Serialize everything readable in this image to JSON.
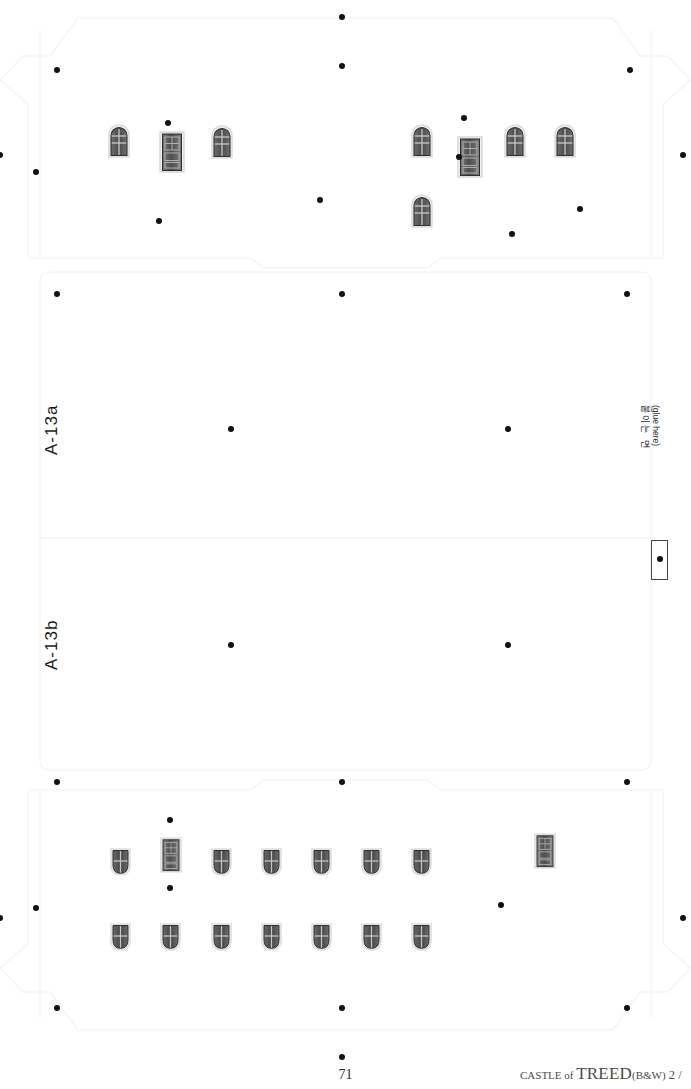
{
  "sheet": {
    "title": "CASTLE of TREED papercraft die-cut sheet",
    "page_number": "71",
    "credit_prefix": "CASTLE of ",
    "credit_title": "TREED",
    "credit_variant": "(B&W)",
    "credit_suffix": " 2 /",
    "background_color": "#ffffff",
    "line_color": "#f0f0f0",
    "dot_color": "#111111"
  },
  "part_labels": [
    {
      "name": "part-label-a13a",
      "text": "A-13a",
      "x": 42,
      "y": 455
    },
    {
      "name": "part-label-a13b",
      "text": "A-13b",
      "x": 42,
      "y": 670
    }
  ],
  "glue_tab": {
    "korean_label": "붙이는 면",
    "english_label": "(glue here)"
  },
  "window_groups": [
    {
      "name": "top-left-facade",
      "pieces": [
        {
          "type": "arch-win",
          "x": 108,
          "y": 124
        },
        {
          "type": "door",
          "x": 159,
          "y": 131
        },
        {
          "type": "arch-win",
          "x": 211,
          "y": 125
        }
      ]
    },
    {
      "name": "top-right-facade",
      "pieces": [
        {
          "type": "arch-win",
          "x": 411,
          "y": 124
        },
        {
          "type": "door",
          "x": 457,
          "y": 136
        },
        {
          "type": "arch-win",
          "x": 504,
          "y": 124
        },
        {
          "type": "arch-win",
          "x": 554,
          "y": 124
        },
        {
          "type": "arch-win",
          "x": 411,
          "y": 194
        }
      ]
    },
    {
      "name": "bottom-facade-row-1",
      "pieces": [
        {
          "type": "shield-win",
          "x": 110,
          "y": 847
        },
        {
          "type": "door-sm",
          "x": 160,
          "y": 837
        },
        {
          "type": "shield-win",
          "x": 211,
          "y": 847
        },
        {
          "type": "shield-win",
          "x": 261,
          "y": 847
        },
        {
          "type": "shield-win",
          "x": 311,
          "y": 847
        },
        {
          "type": "shield-win",
          "x": 361,
          "y": 847
        },
        {
          "type": "shield-win",
          "x": 411,
          "y": 847
        },
        {
          "type": "door-sm",
          "x": 534,
          "y": 833
        }
      ]
    },
    {
      "name": "bottom-facade-row-2",
      "pieces": [
        {
          "type": "shield-win",
          "x": 110,
          "y": 922
        },
        {
          "type": "shield-win",
          "x": 160,
          "y": 922
        },
        {
          "type": "shield-win",
          "x": 211,
          "y": 922
        },
        {
          "type": "shield-win",
          "x": 261,
          "y": 922
        },
        {
          "type": "shield-win",
          "x": 311,
          "y": 922
        },
        {
          "type": "shield-win",
          "x": 361,
          "y": 922
        },
        {
          "type": "shield-win",
          "x": 411,
          "y": 922
        }
      ]
    }
  ],
  "registration_dots": [
    {
      "x": 342,
      "y": 17
    },
    {
      "x": 342,
      "y": 66
    },
    {
      "x": 57,
      "y": 70
    },
    {
      "x": 630,
      "y": 70
    },
    {
      "x": 168,
      "y": 123
    },
    {
      "x": 464,
      "y": 118
    },
    {
      "x": 0,
      "y": 155
    },
    {
      "x": 683,
      "y": 155
    },
    {
      "x": 36,
      "y": 172
    },
    {
      "x": 459,
      "y": 157
    },
    {
      "x": 320,
      "y": 200
    },
    {
      "x": 580,
      "y": 209
    },
    {
      "x": 159,
      "y": 221
    },
    {
      "x": 512,
      "y": 234
    },
    {
      "x": 57,
      "y": 294
    },
    {
      "x": 342,
      "y": 294
    },
    {
      "x": 627,
      "y": 294
    },
    {
      "x": 231,
      "y": 429
    },
    {
      "x": 508,
      "y": 429
    },
    {
      "x": 231,
      "y": 645
    },
    {
      "x": 508,
      "y": 645
    },
    {
      "x": 57,
      "y": 782
    },
    {
      "x": 342,
      "y": 782
    },
    {
      "x": 627,
      "y": 782
    },
    {
      "x": 170,
      "y": 820
    },
    {
      "x": 170,
      "y": 888
    },
    {
      "x": 36,
      "y": 908
    },
    {
      "x": 0,
      "y": 918
    },
    {
      "x": 501,
      "y": 905
    },
    {
      "x": 683,
      "y": 918
    },
    {
      "x": 57,
      "y": 1008
    },
    {
      "x": 342,
      "y": 1008
    },
    {
      "x": 627,
      "y": 1008
    },
    {
      "x": 342,
      "y": 1057
    }
  ]
}
